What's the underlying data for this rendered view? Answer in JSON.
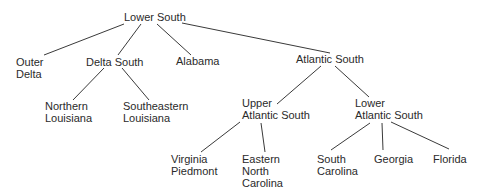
{
  "diagram": {
    "type": "tree",
    "colors": {
      "background": "#ffffff",
      "text": "#2a2a2a",
      "line": "#3a3a3a"
    },
    "nodes": [
      {
        "id": "lower-south",
        "lines": [
          "Lower South"
        ],
        "x": 124,
        "y": 11
      },
      {
        "id": "outer-delta",
        "lines": [
          "Outer",
          "Delta"
        ],
        "x": 16,
        "y": 56
      },
      {
        "id": "delta-south",
        "lines": [
          "Delta South"
        ],
        "x": 86,
        "y": 56
      },
      {
        "id": "alabama",
        "lines": [
          "Alabama"
        ],
        "x": 176,
        "y": 55
      },
      {
        "id": "atlantic-south",
        "lines": [
          "Atlantic South"
        ],
        "x": 296,
        "y": 53
      },
      {
        "id": "northern-louisiana",
        "lines": [
          "Northern",
          "Louisiana"
        ],
        "x": 45,
        "y": 100
      },
      {
        "id": "southeastern-louisiana",
        "lines": [
          "Southeastern",
          "Louisiana"
        ],
        "x": 123,
        "y": 100
      },
      {
        "id": "upper-atlantic-south",
        "lines": [
          "Upper",
          "Atlantic South"
        ],
        "x": 242,
        "y": 97
      },
      {
        "id": "lower-atlantic-south",
        "lines": [
          "Lower",
          "Atlantic South"
        ],
        "x": 355,
        "y": 97
      },
      {
        "id": "virginia-piedmont",
        "lines": [
          "Virginia",
          "Piedmont"
        ],
        "x": 171,
        "y": 153
      },
      {
        "id": "eastern-north-carolina",
        "lines": [
          "Eastern",
          "North",
          "Carolina"
        ],
        "x": 242,
        "y": 153
      },
      {
        "id": "south-carolina",
        "lines": [
          "South",
          "Carolina"
        ],
        "x": 317,
        "y": 153
      },
      {
        "id": "georgia",
        "lines": [
          "Georgia"
        ],
        "x": 374,
        "y": 153
      },
      {
        "id": "florida",
        "lines": [
          "Florida"
        ],
        "x": 433,
        "y": 153
      }
    ],
    "edges": [
      {
        "from": "lower-south",
        "to": "outer-delta",
        "x1": 124,
        "y1": 24,
        "x2": 44,
        "y2": 55
      },
      {
        "from": "lower-south",
        "to": "delta-south",
        "x1": 141,
        "y1": 24,
        "x2": 118,
        "y2": 55
      },
      {
        "from": "lower-south",
        "to": "alabama",
        "x1": 157,
        "y1": 24,
        "x2": 191,
        "y2": 55
      },
      {
        "from": "lower-south",
        "to": "atlantic-south",
        "x1": 182,
        "y1": 23,
        "x2": 330,
        "y2": 53
      },
      {
        "from": "delta-south",
        "to": "northern-louisiana",
        "x1": 104,
        "y1": 68,
        "x2": 73,
        "y2": 100
      },
      {
        "from": "delta-south",
        "to": "southeastern-louisiana",
        "x1": 122,
        "y1": 68,
        "x2": 149,
        "y2": 100
      },
      {
        "from": "atlantic-south",
        "to": "upper-atlantic-south",
        "x1": 321,
        "y1": 66,
        "x2": 277,
        "y2": 104
      },
      {
        "from": "atlantic-south",
        "to": "lower-atlantic-south",
        "x1": 335,
        "y1": 66,
        "x2": 369,
        "y2": 97
      },
      {
        "from": "upper-atlantic-south",
        "to": "virginia-piedmont",
        "x1": 240,
        "y1": 122,
        "x2": 201,
        "y2": 152
      },
      {
        "from": "upper-atlantic-south",
        "to": "eastern-north-carolina",
        "x1": 261,
        "y1": 123,
        "x2": 265,
        "y2": 152
      },
      {
        "from": "lower-atlantic-south",
        "to": "south-carolina",
        "x1": 370,
        "y1": 123,
        "x2": 331,
        "y2": 150
      },
      {
        "from": "lower-atlantic-south",
        "to": "georgia",
        "x1": 382,
        "y1": 123,
        "x2": 383,
        "y2": 150
      },
      {
        "from": "lower-atlantic-south",
        "to": "florida",
        "x1": 391,
        "y1": 122,
        "x2": 449,
        "y2": 149
      }
    ]
  }
}
